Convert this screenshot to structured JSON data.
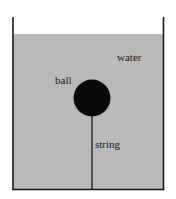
{
  "diagram": {
    "title": "",
    "labels": {
      "water": "water",
      "ball": "ball",
      "string": "string"
    },
    "colors": {
      "background": "#ffffff",
      "water": "#b9b9b9",
      "container_wall": "#1a1a1a",
      "ball": "#0a0a0a",
      "string": "#111111",
      "text": "#1a1a1a"
    },
    "components": [
      {
        "id": "container",
        "type": "open-top tank"
      },
      {
        "id": "water",
        "type": "fluid fill"
      },
      {
        "id": "ball",
        "type": "solid sphere, submerged"
      },
      {
        "id": "string",
        "type": "line anchoring ball to tank bottom"
      }
    ]
  }
}
